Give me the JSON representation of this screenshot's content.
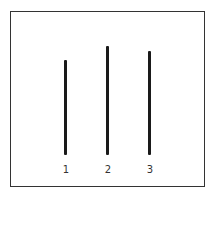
{
  "figure": {
    "line_color": "#1a1a1a",
    "border_color": "#333333",
    "lines": [
      {
        "label": "1",
        "x": 65,
        "top": 60,
        "bottom": 155
      },
      {
        "label": "2",
        "x": 107,
        "top": 46,
        "bottom": 155
      },
      {
        "label": "3",
        "x": 150,
        "top": 51,
        "bottom": 155
      }
    ]
  }
}
